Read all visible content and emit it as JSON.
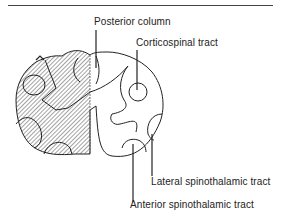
{
  "figure": {
    "type": "spinal cord cross-section",
    "left_half": "hatched",
    "right_half": "unhatched"
  },
  "labels": {
    "posterior_column": "Posterior column",
    "corticospinal_tract": "Corticospinal tract",
    "lateral_spinothalamic_tract": "Lateral spinothalamic tract",
    "anterior_spinothalamic_tract": "Anterior spinothalamic tract"
  },
  "colors": {
    "line": "#222222",
    "background": "#ffffff"
  }
}
